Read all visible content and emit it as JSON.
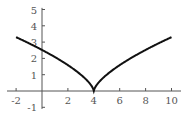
{
  "chart_data": {
    "type": "line",
    "title": "",
    "xlabel": "",
    "ylabel": "",
    "function": "y = |x - 4|^(2/3)",
    "xlim": [
      -2.5,
      10.8
    ],
    "ylim": [
      -1.2,
      5.2
    ],
    "x_ticks": [
      -2,
      2,
      4,
      6,
      8,
      10
    ],
    "x_tick_labels": [
      "-2",
      "2",
      "4",
      "6",
      "8",
      "10"
    ],
    "y_ticks": [
      -1,
      1,
      2,
      3,
      4,
      5
    ],
    "y_tick_labels": [
      "-1",
      "1",
      "2",
      "3",
      "4",
      "5"
    ],
    "grid": false,
    "legend": null,
    "series": [
      {
        "name": "curve",
        "x": [
          -2,
          -1,
          0,
          1,
          2,
          3,
          3.5,
          4,
          4.5,
          5,
          6,
          7,
          8,
          9,
          10
        ],
        "y": [
          3.3,
          2.92,
          2.52,
          2.08,
          1.59,
          1.0,
          0.63,
          0,
          0.63,
          1.0,
          1.59,
          2.08,
          2.52,
          2.92,
          3.3
        ],
        "color": "#111111"
      }
    ],
    "colors": {
      "axis": "#555555",
      "curve": "#111111",
      "text": "#555555"
    }
  }
}
